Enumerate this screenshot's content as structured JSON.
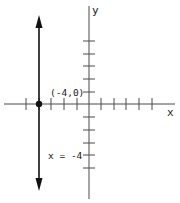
{
  "figure": {
    "type": "coordinate-plane-graph",
    "axes": {
      "x_label": "x",
      "y_label": "y",
      "tick_spacing_units": 1,
      "x_ticks": [
        -5,
        -4,
        -3,
        -2,
        -1,
        1,
        2,
        3,
        4,
        5
      ],
      "y_ticks": [
        -5,
        -4,
        -3,
        -2,
        -1,
        1,
        2,
        3,
        4,
        5
      ]
    },
    "line": {
      "equation_label": "x = -4",
      "kind": "vertical",
      "x_value": -4,
      "arrows": "both-ends"
    },
    "point": {
      "label": "(-4,0)",
      "x": -4,
      "y": 0
    },
    "colors": {
      "axis": "#4a4a4a",
      "line": "#111111",
      "point": "#111111",
      "background": "#ffffff"
    }
  }
}
